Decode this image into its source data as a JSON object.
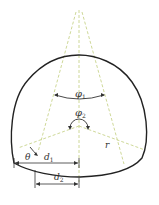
{
  "diagram": {
    "type": "tunnel-cross-section",
    "labels": {
      "phi1": "φ",
      "phi1_sub": "1",
      "phi2": "φ",
      "phi2_sub": "2",
      "r": "r",
      "theta": "θ",
      "d1": "d",
      "d1_sub": "1",
      "d2": "d",
      "d2_sub": "2"
    },
    "colors": {
      "outline": "#222222",
      "construction_lines": "#c8d48c",
      "dimension_lines": "#333333"
    }
  }
}
